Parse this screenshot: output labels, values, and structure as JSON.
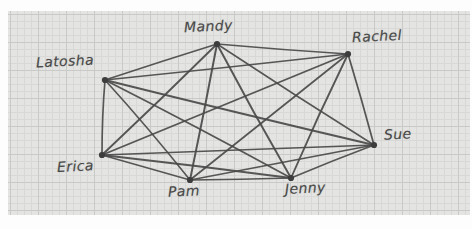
{
  "diagram": {
    "paper": {
      "background_color": "#e4e4e2",
      "grid_line_color": "#c9c9c7",
      "grid_minor_color": "#d8d8d6",
      "grid_cell_px": 28,
      "border_color": "#ffffff"
    },
    "ink_color": "#4a4a4a",
    "node_color": "#3d3d3d",
    "type": "complete-graph",
    "node_count": 7,
    "edge_count": 21,
    "nodes": [
      {
        "id": "latosha",
        "label": "Latosha",
        "x": 105,
        "y": 80,
        "label_x": 36,
        "label_y": 53
      },
      {
        "id": "mandy",
        "label": "Mandy",
        "x": 217,
        "y": 44,
        "label_x": 184,
        "label_y": 18
      },
      {
        "id": "rachel",
        "label": "Rachel",
        "x": 348,
        "y": 54,
        "label_x": 352,
        "label_y": 28
      },
      {
        "id": "sue",
        "label": "Sue",
        "x": 374,
        "y": 145,
        "label_x": 384,
        "label_y": 126
      },
      {
        "id": "jenny",
        "label": "Jenny",
        "x": 291,
        "y": 178,
        "label_x": 285,
        "label_y": 180
      },
      {
        "id": "pam",
        "label": "Pam",
        "x": 190,
        "y": 180,
        "label_x": 168,
        "label_y": 183
      },
      {
        "id": "erica",
        "label": "Erica",
        "x": 102,
        "y": 155,
        "label_x": 57,
        "label_y": 158
      }
    ],
    "edges": [
      {
        "from": "latosha",
        "to": "mandy"
      },
      {
        "from": "latosha",
        "to": "rachel"
      },
      {
        "from": "latosha",
        "to": "sue"
      },
      {
        "from": "latosha",
        "to": "jenny"
      },
      {
        "from": "latosha",
        "to": "pam"
      },
      {
        "from": "latosha",
        "to": "erica"
      },
      {
        "from": "mandy",
        "to": "rachel"
      },
      {
        "from": "mandy",
        "to": "sue"
      },
      {
        "from": "mandy",
        "to": "jenny"
      },
      {
        "from": "mandy",
        "to": "pam"
      },
      {
        "from": "mandy",
        "to": "erica"
      },
      {
        "from": "rachel",
        "to": "sue"
      },
      {
        "from": "rachel",
        "to": "jenny"
      },
      {
        "from": "rachel",
        "to": "pam"
      },
      {
        "from": "rachel",
        "to": "erica"
      },
      {
        "from": "sue",
        "to": "jenny"
      },
      {
        "from": "sue",
        "to": "pam"
      },
      {
        "from": "sue",
        "to": "erica"
      },
      {
        "from": "jenny",
        "to": "pam"
      },
      {
        "from": "jenny",
        "to": "erica"
      },
      {
        "from": "pam",
        "to": "erica"
      }
    ]
  }
}
